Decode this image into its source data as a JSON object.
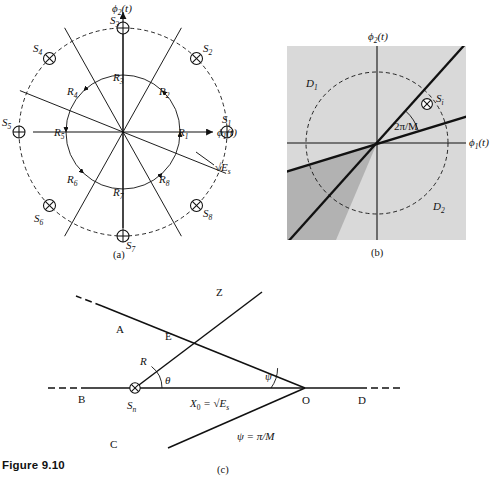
{
  "figure": {
    "caption": "Figure 9.10",
    "panels": [
      {
        "id": "a",
        "caption": "(a)"
      },
      {
        "id": "b",
        "caption": "(b)"
      },
      {
        "id": "c",
        "caption": "(c)"
      }
    ]
  },
  "panel_a": {
    "title_axis_vertical": "ϕ",
    "axis_vertical_sub": "2",
    "axis_vertical_arg": "(t)",
    "axis_horizontal": "ϕ",
    "axis_horizontal_sub": "1",
    "axis_horizontal_arg": "(t)",
    "radius_label": "√E",
    "radius_label_sub": "s",
    "signals": [
      {
        "name": "S",
        "sub": "1",
        "angle_deg": 0,
        "marker": "circle-plus"
      },
      {
        "name": "S",
        "sub": "2",
        "angle_deg": 45,
        "marker": "circle-times"
      },
      {
        "name": "S",
        "sub": "3",
        "angle_deg": 90,
        "marker": "circle-plus"
      },
      {
        "name": "S",
        "sub": "4",
        "angle_deg": 135,
        "marker": "circle-times"
      },
      {
        "name": "S",
        "sub": "5",
        "angle_deg": 180,
        "marker": "circle-plus"
      },
      {
        "name": "S",
        "sub": "6",
        "angle_deg": 225,
        "marker": "circle-times"
      },
      {
        "name": "S",
        "sub": "7",
        "angle_deg": 270,
        "marker": "circle-plus"
      },
      {
        "name": "S",
        "sub": "8",
        "angle_deg": 315,
        "marker": "circle-times"
      }
    ],
    "regions": [
      {
        "name": "R",
        "sub": "1",
        "angle_deg": 0
      },
      {
        "name": "R",
        "sub": "2",
        "angle_deg": 45
      },
      {
        "name": "R",
        "sub": "3",
        "angle_deg": 90
      },
      {
        "name": "R",
        "sub": "4",
        "angle_deg": 135
      },
      {
        "name": "R",
        "sub": "5",
        "angle_deg": 180
      },
      {
        "name": "R",
        "sub": "6",
        "angle_deg": 225
      },
      {
        "name": "R",
        "sub": "7",
        "angle_deg": 270
      },
      {
        "name": "R",
        "sub": "8",
        "angle_deg": 315
      }
    ]
  },
  "panel_b": {
    "axis_vertical": "ϕ",
    "axis_vertical_sub": "2",
    "axis_vertical_arg": "(t)",
    "axis_horizontal": "ϕ",
    "axis_horizontal_sub": "1",
    "axis_horizontal_arg": "(t)",
    "region_1": "D",
    "region_1_sub": "1",
    "region_2": "D",
    "region_2_sub": "2",
    "signal": "S",
    "signal_sub": "i",
    "signal_marker": "circle-times",
    "angle_label": "2π/M",
    "boundary_upper_deg": 48,
    "boundary_lower_deg": 17,
    "bg_color": "#d9d9d9",
    "wedge_color": "#b2b2b2"
  },
  "panel_c": {
    "points": [
      {
        "label": "A"
      },
      {
        "label": "B"
      },
      {
        "label": "C"
      },
      {
        "label": "D"
      },
      {
        "label": "E"
      },
      {
        "label": "O"
      },
      {
        "label": "Z"
      }
    ],
    "signal": "S",
    "signal_sub": "n",
    "signal_marker": "circle-times",
    "ray_label": "R",
    "angle_theta": "θ",
    "angle_psi": "ψ",
    "distance_label": "X",
    "distance_sub": "0",
    "distance_eq": " = √E",
    "distance_eq_sub": "s",
    "note": "ψ = π/M"
  }
}
